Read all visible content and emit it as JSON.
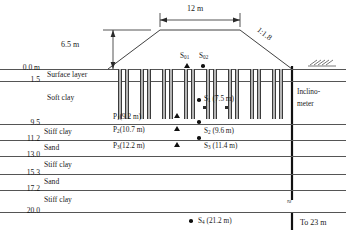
{
  "figure": {
    "dimensions": {
      "crest_width": "12 m",
      "embankment_height": "6.5 m",
      "slope_ratio": "1:1.8"
    },
    "ground_surface_label": "0.0 m",
    "depth_labels": [
      "0.0 m",
      "1.5",
      "9.5",
      "11.2",
      "13.0",
      "15.3",
      "17.2",
      "20.0"
    ],
    "soil_layers": [
      {
        "name": "Surface layer",
        "top": "0.0 m",
        "bottom": "1.5"
      },
      {
        "name": "Soft clay",
        "top": "1.5",
        "bottom": "9.5"
      },
      {
        "name": "Stiff clay",
        "top": "9.5",
        "bottom": "11.2"
      },
      {
        "name": "Sand",
        "top": "11.2",
        "bottom": "13.0"
      },
      {
        "name": "Stiff clay",
        "top": "13.0",
        "bottom": "15.3"
      },
      {
        "name": "Sand",
        "top": "15.3",
        "bottom": "17.2"
      },
      {
        "name": "Stiff clay",
        "top": "17.2",
        "bottom": "20.0"
      }
    ],
    "instruments": {
      "settlement_surface": [
        {
          "name": "S",
          "subscript": "01"
        },
        {
          "name": "S",
          "subscript": "02"
        }
      ],
      "settlement_points": [
        {
          "name": "S",
          "subscript": "1",
          "depth": "(7.5 m)"
        },
        {
          "name": "S",
          "subscript": "2",
          "depth": "(9.6 m)"
        },
        {
          "name": "S",
          "subscript": "3",
          "depth": "(11.4 m)"
        },
        {
          "name": "S",
          "subscript": "4",
          "depth": "(21.2 m)"
        }
      ],
      "piezometers": [
        {
          "name": "P",
          "subscript": "1",
          "depth": "(9.2 m)"
        },
        {
          "name": "P",
          "subscript": "2",
          "depth": "(10.7 m)"
        },
        {
          "name": "P",
          "subscript": "3",
          "depth": "(12.2 m)"
        }
      ],
      "inclinometer": {
        "label_line1": "Inclino-",
        "label_line2": "meter",
        "extent_note": "To 23 m",
        "break_symbol": "≈"
      }
    },
    "colors": {
      "line": "#2a2a2a",
      "layer_line": "#555555",
      "column_fill": "#bdbdbd",
      "marker": "#111111"
    }
  }
}
